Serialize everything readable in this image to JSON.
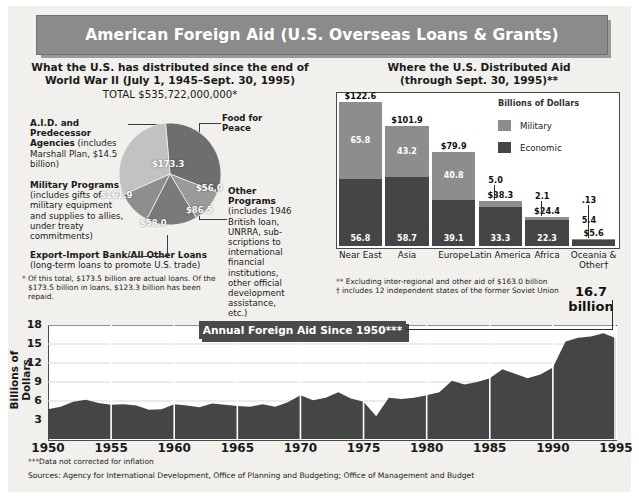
{
  "title": "American Foreign Aid (U.S. Overseas Loans & Grants)",
  "left_panel": {
    "heading_line1": "What the U.S. has distributed since the end of",
    "heading_line2": "World War II (July 1, 1945–Sept. 30, 1995)",
    "total": "TOTAL $535,722,000,000*",
    "labels": {
      "aid_bold": "A.I.D. and Predecessor Agencies",
      "aid_rest": " (includes Marshall Plan, $14.5 billion)",
      "military_bold": "Military Programs",
      "military_rest": " (includes gifts of military equipment and supplies to allies, under treaty commitments)",
      "exim_bold": "Export-Import Bank/All Other Loans",
      "exim_rest": " (long-term loans to promote U.S. trade)",
      "food": "Food for Peace",
      "other_bold": "Other Programs",
      "other_rest": " (includes 1946 British loan, UNRRA, sub-scriptions to international financial institutions, other official development assistance, etc.)"
    },
    "footnote": "Of this total, $173.5 billion are actual loans. Of the $173.5 billion in loans, $123.3 billion has been repaid.",
    "footnote_marker": "*"
  },
  "right_panel": {
    "heading_line1": "Where the U.S. Distributed Aid",
    "heading_line2": "(through Sept. 30, 1995)**",
    "legend_title": "Billions of Dollars",
    "legend": [
      {
        "key": "military",
        "label": "Military",
        "color": "#8d8d8d"
      },
      {
        "key": "economic",
        "label": "Economic",
        "color": "#454545"
      }
    ],
    "footnote1": "** Excluding inter-regional and other aid of $163.0 billion",
    "footnote2": "† includes 12 independent states of the former Soviet Union",
    "big_number_line1": "16.7",
    "big_number_line2": "billion"
  },
  "bottom_panel": {
    "banner": "Annual Foreign Aid Since 1950***",
    "ylabel": "Billions of Dollars",
    "footnote": "***Data not corrected for inflation",
    "sources": "Sources: Agency for International Development, Office of Planning and Budgeting; Office of Management and Budget"
  },
  "chart_data": [
    {
      "type": "pie",
      "title": "What the U.S. has distributed since the end of World War II",
      "unit": "billions of dollars",
      "total_label": "TOTAL $535,722,000,000*",
      "slices": [
        {
          "label": "A.I.D. and Predecessor Agencies",
          "value": 173.3,
          "display": "$173.3",
          "color": "#6e6e6e"
        },
        {
          "label": "Food for Peace",
          "value": 56.0,
          "display": "$56.0",
          "color": "#9a9a9a"
        },
        {
          "label": "Other Programs",
          "value": 86.5,
          "display": "$86.5",
          "color": "#7a7a7a"
        },
        {
          "label": "Export-Import Bank/All Other Loans",
          "value": 58.0,
          "display": "$58.0",
          "color": "#8e8e8e"
        },
        {
          "label": "Military Programs",
          "value": 161.9,
          "display": "$161.9",
          "color": "#c2c2c2"
        }
      ]
    },
    {
      "type": "bar",
      "subtype": "stacked",
      "title": "Where the U.S. Distributed Aid (through Sept. 30, 1995)**",
      "ylabel": "Billions of Dollars",
      "categories": [
        "Near East",
        "Asia",
        "Europe",
        "Latin America",
        "Africa",
        "Oceania & Other†"
      ],
      "series": [
        {
          "name": "Economic",
          "color": "#454545",
          "values": [
            56.8,
            58.7,
            39.1,
            33.3,
            22.3,
            5.4
          ],
          "labels": [
            "56.8",
            "58.7",
            "39.1",
            "33.3",
            "22.3",
            "5.4"
          ]
        },
        {
          "name": "Military",
          "color": "#8d8d8d",
          "values": [
            65.8,
            43.2,
            40.8,
            5.0,
            2.1,
            0.13
          ],
          "labels": [
            "65.8",
            "43.2",
            "40.8",
            "5.0",
            "2.1",
            ".13"
          ]
        }
      ],
      "totals": [
        122.6,
        101.9,
        79.9,
        38.3,
        24.4,
        5.6
      ],
      "total_labels": [
        "$122.6",
        "$101.9",
        "$79.9",
        "$38.3",
        "$24.4",
        "$5.6"
      ],
      "ylim": [
        0,
        130
      ]
    },
    {
      "type": "area",
      "title": "Annual Foreign Aid Since 1950***",
      "ylabel": "Billions of Dollars",
      "xlabel": "",
      "ylim": [
        0,
        18
      ],
      "yticks": [
        3,
        6,
        9,
        12,
        15,
        18
      ],
      "xticks": [
        1950,
        1955,
        1960,
        1965,
        1970,
        1975,
        1980,
        1985,
        1990,
        1995
      ],
      "xlim": [
        1950,
        1995
      ],
      "grid": true,
      "end_annotation": "16.7 billion",
      "x": [
        1950,
        1951,
        1952,
        1953,
        1954,
        1955,
        1956,
        1957,
        1958,
        1959,
        1960,
        1961,
        1962,
        1963,
        1964,
        1965,
        1966,
        1967,
        1968,
        1969,
        1970,
        1971,
        1972,
        1973,
        1974,
        1975,
        1976,
        1977,
        1978,
        1979,
        1980,
        1981,
        1982,
        1983,
        1984,
        1985,
        1986,
        1987,
        1988,
        1989,
        1990,
        1991,
        1992,
        1993,
        1994,
        1995
      ],
      "y": [
        4.7,
        5.1,
        5.9,
        6.2,
        5.7,
        5.4,
        5.5,
        5.3,
        4.6,
        4.7,
        5.5,
        5.3,
        5.0,
        5.6,
        5.4,
        5.2,
        5.1,
        5.5,
        5.1,
        5.8,
        6.9,
        6.1,
        6.5,
        7.4,
        6.4,
        5.9,
        3.6,
        6.5,
        6.3,
        6.5,
        6.9,
        7.4,
        9.2,
        8.6,
        9.0,
        9.6,
        11.0,
        10.3,
        9.6,
        10.2,
        11.3,
        15.4,
        16.0,
        16.2,
        16.7,
        15.9
      ]
    }
  ]
}
